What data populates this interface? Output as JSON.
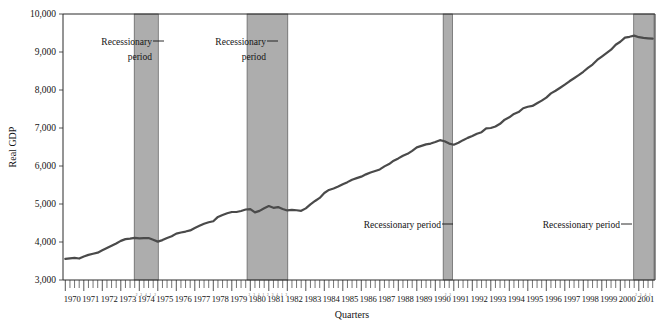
{
  "chart_data": {
    "type": "line",
    "title": "",
    "xlabel": "Quarters",
    "ylabel": "Real GDP",
    "ylim": [
      3000,
      10000
    ],
    "ytick_labels": [
      "3,000",
      "4,000",
      "5,000",
      "6,000",
      "7,000",
      "8,000",
      "9,000",
      "10,000"
    ],
    "ytick_values": [
      3000,
      4000,
      5000,
      6000,
      7000,
      8000,
      9000,
      10000
    ],
    "grid": false,
    "legend": "none",
    "xtick_labels": [
      "1970",
      "1971",
      "1972",
      "1973",
      "1974",
      "1975",
      "1976",
      "1977",
      "1978",
      "1979",
      "1980",
      "1981",
      "1982",
      "1983",
      "1984",
      "1985",
      "1986",
      "1987",
      "1988",
      "1989",
      "1990",
      "1991",
      "1992",
      "1993",
      "1994",
      "1995",
      "1996",
      "1997",
      "1998",
      "1999",
      "2000",
      "2001"
    ],
    "x_start_year": 1970,
    "x_end_year": 2001,
    "quarters_per_year": 4,
    "series": [
      {
        "name": "Real GDP",
        "color": "#4a4a4a",
        "values": [
          3555,
          3570,
          3580,
          3565,
          3620,
          3660,
          3690,
          3720,
          3780,
          3840,
          3900,
          3960,
          4030,
          4075,
          4090,
          4110,
          4095,
          4100,
          4105,
          4060,
          4010,
          4050,
          4105,
          4150,
          4220,
          4250,
          4275,
          4305,
          4370,
          4425,
          4480,
          4520,
          4545,
          4660,
          4710,
          4755,
          4790,
          4790,
          4815,
          4855,
          4865,
          4780,
          4820,
          4890,
          4945,
          4900,
          4920,
          4870,
          4830,
          4845,
          4835,
          4820,
          4885,
          4990,
          5080,
          5160,
          5290,
          5370,
          5410,
          5460,
          5520,
          5575,
          5640,
          5680,
          5720,
          5780,
          5830,
          5870,
          5910,
          5990,
          6050,
          6140,
          6200,
          6270,
          6320,
          6400,
          6490,
          6530,
          6570,
          6590,
          6630,
          6680,
          6650,
          6590,
          6560,
          6610,
          6680,
          6740,
          6790,
          6850,
          6890,
          6990,
          7000,
          7040,
          7110,
          7220,
          7280,
          7370,
          7420,
          7520,
          7560,
          7580,
          7650,
          7720,
          7800,
          7910,
          7980,
          8060,
          8140,
          8230,
          8310,
          8390,
          8480,
          8580,
          8670,
          8790,
          8880,
          8970,
          9060,
          9190,
          9270,
          9380,
          9400,
          9430,
          9390,
          9370,
          9360,
          9350
        ]
      }
    ],
    "shaded_regions": [
      {
        "label": "Recessionary period",
        "start_year": 1973.85,
        "end_year": 1975.15,
        "color": "#adadad"
      },
      {
        "label": "Recessionary period",
        "start_year": 1979.95,
        "end_year": 1982.15,
        "color": "#adadad"
      },
      {
        "label": "Recessionary period",
        "start_year": 1990.55,
        "end_year": 1991.05,
        "color": "#adadad"
      },
      {
        "label": "Recessionary period",
        "start_year": 2000.85,
        "end_year": 2001.95,
        "color": "#adadad"
      }
    ],
    "annotations": [
      {
        "text_line1": "Recessionary",
        "text_line2": "period",
        "target_region": 0,
        "placement": "top-left-two-line"
      },
      {
        "text_line1": "Recessionary",
        "text_line2": "period",
        "target_region": 1,
        "placement": "top-left-two-line"
      },
      {
        "text_line1": "Recessionary period",
        "text_line2": "",
        "target_region": 2,
        "placement": "mid-left-one-line"
      },
      {
        "text_line1": "Recessionary period",
        "text_line2": "",
        "target_region": 3,
        "placement": "mid-left-one-line"
      }
    ]
  }
}
